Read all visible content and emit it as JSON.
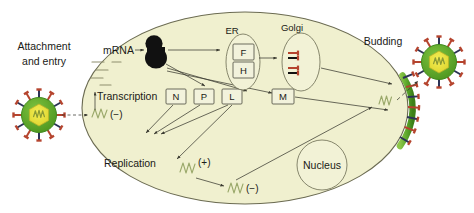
{
  "figure": {
    "canvas": {
      "width": 474,
      "height": 213
    },
    "colors": {
      "cytoplasm": "#f0f0cf",
      "cell_outline": "#6b6b52",
      "capsid_green": "#5faa2d",
      "capsid_green_dark": "#3f8a1e",
      "core_yellow": "#e8e23c",
      "genome_green": "#7aa93c",
      "spike_red": "#b5442e",
      "spike_navy": "#2c3356",
      "ribosome_black": "#111111",
      "box_fill": "#f2f2dc",
      "text": "#1a1a16",
      "background": "#ffffff"
    }
  },
  "labels": {
    "attachment_entry_line1": "Attachment",
    "attachment_entry_line2": "and entry",
    "mrna": "mRNA",
    "transcription": "Transcription",
    "replication": "Replication",
    "er": "ER",
    "golgi": "Golgi",
    "nucleus": "Nucleus",
    "budding": "Budding"
  },
  "protein_boxes": [
    {
      "id": "F",
      "label": "F",
      "compartment": "ER"
    },
    {
      "id": "H",
      "label": "H",
      "compartment": "ER"
    },
    {
      "id": "N",
      "label": "N",
      "compartment": "cytoplasm"
    },
    {
      "id": "P",
      "label": "P",
      "compartment": "cytoplasm"
    },
    {
      "id": "L",
      "label": "L",
      "compartment": "cytoplasm"
    },
    {
      "id": "M",
      "label": "M",
      "compartment": "cytoplasm"
    }
  ],
  "rna_species": [
    {
      "id": "genome-entry",
      "sign": "(−)",
      "role": "incoming genome template"
    },
    {
      "id": "antigenome",
      "sign": "(+)",
      "role": "replication intermediate"
    },
    {
      "id": "progeny-genome",
      "sign": "(−)",
      "role": "progeny genome"
    }
  ],
  "virions": [
    {
      "id": "input-virion",
      "position": "left-extracellular",
      "state": "attaching"
    },
    {
      "id": "progeny-virion",
      "position": "right-extracellular",
      "state": "released"
    }
  ],
  "organelles": [
    {
      "id": "er",
      "label": "ER",
      "shape": "ellipse"
    },
    {
      "id": "golgi",
      "label": "Golgi",
      "shape": "ellipse"
    },
    {
      "id": "nucleus",
      "label": "Nucleus",
      "shape": "circle"
    }
  ],
  "glycoprotein_spikes_in_golgi": 2
}
